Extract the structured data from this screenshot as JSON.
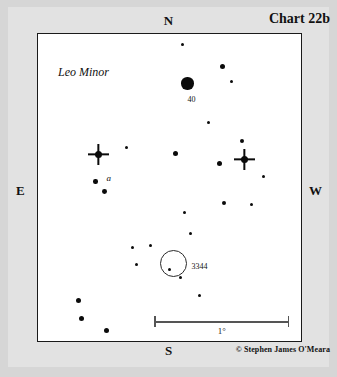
{
  "chart_data": {
    "type": "scatter",
    "title": "Chart 22b",
    "subtitle": "Leo Minor",
    "credit": "© Stephen James O'Meara",
    "xlabel": "",
    "ylabel": "",
    "grid": false,
    "legend_position": "none",
    "orientation": {
      "north": "N",
      "south": "S",
      "east": "E",
      "west": "W",
      "note": "North up, East left (mirror sky view)"
    },
    "scale_bar": {
      "label": "1°",
      "x_start": 155,
      "x_end": 290,
      "y": 317,
      "length_px": 135
    },
    "frame": {
      "x": 37,
      "y": 33,
      "width": 265,
      "height": 309
    },
    "annotations": [
      {
        "text": "Leo Minor",
        "x": 57,
        "y": 65,
        "style": "italic"
      },
      {
        "text": "40",
        "x": 188,
        "y": 97,
        "style": "plain"
      },
      {
        "text": "a",
        "x": 107,
        "y": 175,
        "style": "italic"
      },
      {
        "text": "3344",
        "x": 192,
        "y": 264,
        "style": "plain"
      }
    ],
    "deep_sky_objects": [
      {
        "name": "3344",
        "type": "galaxy",
        "symbol": "open-circle",
        "x": 174,
        "y": 264,
        "diameter_px": 27
      }
    ],
    "stars": [
      {
        "x": 183,
        "y": 45,
        "r": 1.6,
        "spikes": false
      },
      {
        "x": 223,
        "y": 67,
        "r": 2.6,
        "spikes": false
      },
      {
        "x": 232,
        "y": 82,
        "r": 1.8,
        "spikes": false
      },
      {
        "x": 188,
        "y": 84,
        "r": 6.2,
        "spikes": false
      },
      {
        "x": 209,
        "y": 123,
        "r": 1.9,
        "spikes": false
      },
      {
        "x": 243,
        "y": 142,
        "r": 2.0,
        "spikes": false
      },
      {
        "x": 127,
        "y": 148,
        "r": 1.9,
        "spikes": false
      },
      {
        "x": 99,
        "y": 155,
        "r": 3.6,
        "spikes": true
      },
      {
        "x": 176,
        "y": 154,
        "r": 2.6,
        "spikes": false
      },
      {
        "x": 220,
        "y": 164,
        "r": 2.6,
        "spikes": false
      },
      {
        "x": 245,
        "y": 160,
        "r": 3.6,
        "spikes": true
      },
      {
        "x": 264,
        "y": 177,
        "r": 1.7,
        "spikes": false
      },
      {
        "x": 96,
        "y": 182,
        "r": 2.2,
        "spikes": false
      },
      {
        "x": 105,
        "y": 192,
        "r": 2.4,
        "spikes": false
      },
      {
        "x": 225,
        "y": 204,
        "r": 2.0,
        "spikes": false
      },
      {
        "x": 252,
        "y": 205,
        "r": 1.9,
        "spikes": false
      },
      {
        "x": 185,
        "y": 213,
        "r": 1.9,
        "spikes": false
      },
      {
        "x": 191,
        "y": 234,
        "r": 1.9,
        "spikes": false
      },
      {
        "x": 133,
        "y": 248,
        "r": 1.7,
        "spikes": false
      },
      {
        "x": 151,
        "y": 246,
        "r": 1.8,
        "spikes": false
      },
      {
        "x": 137,
        "y": 265,
        "r": 1.7,
        "spikes": false
      },
      {
        "x": 170,
        "y": 270,
        "r": 1.5,
        "spikes": false
      },
      {
        "x": 181,
        "y": 278,
        "r": 1.6,
        "spikes": false
      },
      {
        "x": 200,
        "y": 296,
        "r": 1.7,
        "spikes": false
      },
      {
        "x": 79,
        "y": 301,
        "r": 2.6,
        "spikes": false
      },
      {
        "x": 82,
        "y": 319,
        "r": 2.6,
        "spikes": false
      },
      {
        "x": 107,
        "y": 331,
        "r": 2.6,
        "spikes": false
      }
    ]
  }
}
